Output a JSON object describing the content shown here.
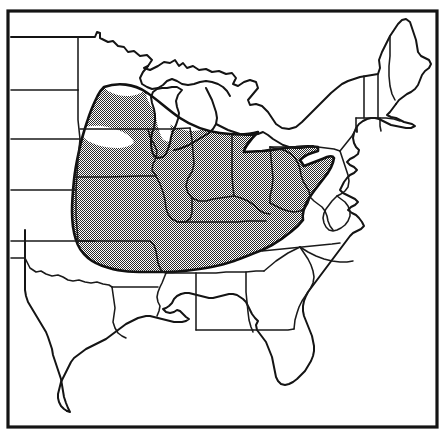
{
  "figure": {
    "kind": "distribution-range-map",
    "title": "",
    "caption": "",
    "region_described": "Eastern United States",
    "width_px": 445,
    "height_px": 435
  },
  "colors": {
    "background": "#ffffff",
    "line": "#1a1a1a",
    "frame": "#141414",
    "stipple_dot": "#2b2b2b",
    "stipple_apparent_gray": "#8f8f8f"
  },
  "frame": {
    "label": "map-border",
    "x": 8,
    "y": 11,
    "width": 429,
    "height": 416,
    "stroke_width": 3.2
  },
  "legend": {
    "present": false,
    "entries": [
      {
        "symbol": "stipple",
        "label": "shaded distribution range"
      }
    ]
  },
  "range_polygon": {
    "name": "shaded-range-area",
    "pattern": "50% checkerboard stipple",
    "description": "Continuous shaded range spanning the Upper Midwest, Corn Belt, Ohio Valley, Appalachian Plateau and Upper South",
    "states_fully_shaded": [
      "Iowa",
      "Illinois",
      "Indiana",
      "Ohio",
      "Missouri",
      "Kentucky",
      "Tennessee",
      "West Virginia"
    ],
    "states_partly_shaded": [
      "Minnesota",
      "Wisconsin",
      "Michigan",
      "Nebraska",
      "Kansas",
      "Arkansas",
      "Pennsylvania",
      "Virginia",
      "New York",
      "Maryland",
      "Oklahoma",
      "Mississippi",
      "Alabama",
      "Georgia",
      "North Carolina"
    ],
    "states_not_shaded": [
      "Maine",
      "New Hampshire",
      "Vermont",
      "Massachusetts",
      "Connecticut",
      "Rhode Island",
      "New Jersey",
      "Delaware",
      "South Carolina",
      "Florida",
      "Louisiana",
      "Texas",
      "North Dakota",
      "South Dakota"
    ]
  },
  "states": [
    {
      "code": "ND",
      "name": "North Dakota"
    },
    {
      "code": "SD",
      "name": "South Dakota"
    },
    {
      "code": "NE",
      "name": "Nebraska"
    },
    {
      "code": "KS",
      "name": "Kansas"
    },
    {
      "code": "OK",
      "name": "Oklahoma"
    },
    {
      "code": "TX",
      "name": "Texas"
    },
    {
      "code": "MN",
      "name": "Minnesota"
    },
    {
      "code": "IA",
      "name": "Iowa"
    },
    {
      "code": "MO",
      "name": "Missouri"
    },
    {
      "code": "AR",
      "name": "Arkansas"
    },
    {
      "code": "LA",
      "name": "Louisiana"
    },
    {
      "code": "WI",
      "name": "Wisconsin"
    },
    {
      "code": "IL",
      "name": "Illinois"
    },
    {
      "code": "MS",
      "name": "Mississippi"
    },
    {
      "code": "MI",
      "name": "Michigan"
    },
    {
      "code": "IN",
      "name": "Indiana"
    },
    {
      "code": "KY",
      "name": "Kentucky"
    },
    {
      "code": "TN",
      "name": "Tennessee"
    },
    {
      "code": "AL",
      "name": "Alabama"
    },
    {
      "code": "OH",
      "name": "Ohio"
    },
    {
      "code": "WV",
      "name": "West Virginia"
    },
    {
      "code": "GA",
      "name": "Georgia"
    },
    {
      "code": "FL",
      "name": "Florida"
    },
    {
      "code": "SC",
      "name": "South Carolina"
    },
    {
      "code": "NC",
      "name": "North Carolina"
    },
    {
      "code": "VA",
      "name": "Virginia"
    },
    {
      "code": "MD",
      "name": "Maryland"
    },
    {
      "code": "DE",
      "name": "Delaware"
    },
    {
      "code": "PA",
      "name": "Pennsylvania"
    },
    {
      "code": "NJ",
      "name": "New Jersey"
    },
    {
      "code": "NY",
      "name": "New York"
    },
    {
      "code": "CT",
      "name": "Connecticut"
    },
    {
      "code": "RI",
      "name": "Rhode Island"
    },
    {
      "code": "MA",
      "name": "Massachusetts"
    },
    {
      "code": "VT",
      "name": "Vermont"
    },
    {
      "code": "NH",
      "name": "New Hampshire"
    },
    {
      "code": "ME",
      "name": "Maine"
    }
  ]
}
